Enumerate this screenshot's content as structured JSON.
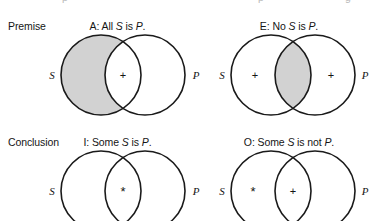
{
  "figure": {
    "background": "#ffffff",
    "stroke_color": "#1a1a1a",
    "shade_color": "#d2d2d2",
    "text_color": "#151515"
  },
  "rows": [
    {
      "label": "Premise",
      "cells": [
        {
          "title_code": "A:",
          "title_text_before": " All ",
          "title_subject": "S",
          "title_middle": " is ",
          "title_predicate": "P",
          "title_end": ".",
          "title_full": "A:  All S is P.",
          "left_label": "S",
          "right_label": "P",
          "shaded_region": "s-only",
          "marks": [
            {
              "region": "overlap",
              "glyph": "+"
            }
          ]
        },
        {
          "title_code": "E:",
          "title_text_before": " No ",
          "title_subject": "S",
          "title_middle": " is ",
          "title_predicate": "P",
          "title_end": ".",
          "title_full": "E:  No S is P.",
          "left_label": "S",
          "right_label": "P",
          "shaded_region": "overlap",
          "marks": [
            {
              "region": "s-only",
              "glyph": "+"
            },
            {
              "region": "p-only",
              "glyph": "+"
            }
          ]
        }
      ]
    },
    {
      "label": "Conclusion",
      "cells": [
        {
          "title_code": "I:",
          "title_text_before": " Some ",
          "title_subject": "S",
          "title_middle": " is ",
          "title_predicate": "P",
          "title_end": ".",
          "title_full": "I:  Some S is P.",
          "left_label": "S",
          "right_label": "P",
          "shaded_region": "none",
          "marks": [
            {
              "region": "overlap",
              "glyph": "*"
            }
          ]
        },
        {
          "title_code": "O:",
          "title_text_before": " Some ",
          "title_subject": "S",
          "title_middle": " is not ",
          "title_predicate": "P",
          "title_end": ".",
          "title_full": "O:  Some S is not P.",
          "left_label": "S",
          "right_label": "P",
          "shaded_region": "none",
          "marks": [
            {
              "region": "s-only",
              "glyph": "*"
            },
            {
              "region": "overlap",
              "glyph": "+"
            }
          ]
        }
      ]
    }
  ]
}
